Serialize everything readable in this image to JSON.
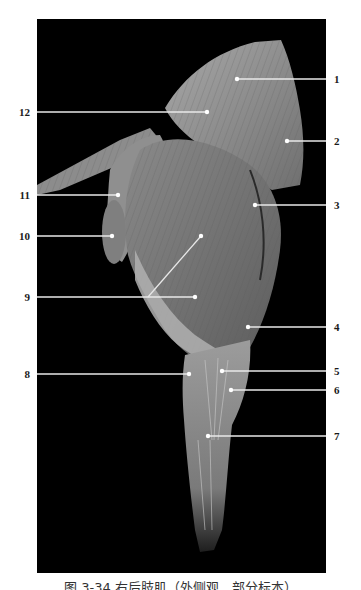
{
  "figure": {
    "caption": "图 3-34 右后肢肌（外侧观，部分标本）",
    "background_color": "#000000",
    "leader_color": "#e8e8e8"
  },
  "labels": {
    "right": [
      {
        "number": "1",
        "y": 79,
        "target_x": 237,
        "target_y": 79
      },
      {
        "number": "2",
        "y": 141,
        "target_x": 287,
        "target_y": 141
      },
      {
        "number": "3",
        "y": 205,
        "target_x": 255,
        "target_y": 205
      },
      {
        "number": "4",
        "y": 327,
        "target_x": 248,
        "target_y": 327
      },
      {
        "number": "5",
        "y": 371,
        "target_x": 222,
        "target_y": 371
      },
      {
        "number": "6",
        "y": 390,
        "target_x": 231,
        "target_y": 390
      },
      {
        "number": "7",
        "y": 436,
        "target_x": 208,
        "target_y": 436
      }
    ],
    "left": [
      {
        "number": "12",
        "y": 112,
        "target_x": 207,
        "target_y": 112
      },
      {
        "number": "11",
        "y": 195,
        "target_x": 118,
        "target_y": 195
      },
      {
        "number": "10",
        "y": 236,
        "target_x": 112,
        "target_y": 236
      },
      {
        "number": "9",
        "y": 297,
        "target_x": 195,
        "target_y": 297
      },
      {
        "number": "8",
        "y": 374,
        "target_x": 189,
        "target_y": 374
      }
    ]
  }
}
